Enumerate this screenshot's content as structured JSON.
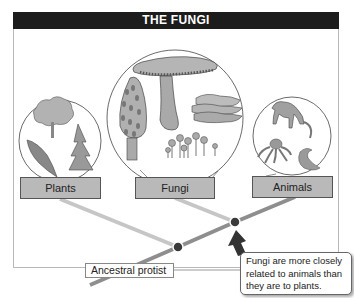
{
  "title": "THE FUNGI",
  "groups": [
    {
      "label": "Plants",
      "illustrations": [
        "tree",
        "fern",
        "conifer"
      ]
    },
    {
      "label": "Fungi",
      "illustrations": [
        "gilled-mushroom",
        "morel",
        "shelf-fungus",
        "small-mushrooms"
      ]
    },
    {
      "label": "Animals",
      "illustrations": [
        "monkey",
        "octopus",
        "worm"
      ]
    }
  ],
  "root_label": "Ancestral protist",
  "callout_text": "Fungi are more closely related to animals than they are to plants.",
  "colors": {
    "title_bg": "#1c1c1c",
    "title_text": "#ffffff",
    "label_box": "#b9b9b9",
    "branch_light": "#c4c4c4",
    "branch_dark": "#8a8a8a",
    "node": "#3a3a3a",
    "illustration_fill": "#a9a9a9"
  }
}
